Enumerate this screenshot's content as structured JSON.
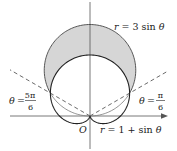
{
  "diagram": {
    "type": "polar-curves",
    "origin_label": "O",
    "curves": [
      {
        "name": "circle",
        "equation": "r = 3 sin θ",
        "label": "r = 3 sin θ"
      },
      {
        "name": "cardioid",
        "equation": "r = 1 + sin θ",
        "label": "r = 1 + sin θ"
      }
    ],
    "angle_lines": [
      {
        "label_theta": "θ",
        "label_eq": "=",
        "numerator": "5π",
        "denominator": "6",
        "value": "5π/6"
      },
      {
        "label_theta": "θ",
        "label_eq": "=",
        "numerator": "π",
        "denominator": "6",
        "value": "π/6"
      }
    ],
    "shaded_region": "inside r = 3 sin θ and outside r = 1 + sin θ",
    "colors": {
      "shade": "#d6d6d6",
      "curve": "#222222",
      "thin": "#777777",
      "axis": "#555555"
    }
  }
}
